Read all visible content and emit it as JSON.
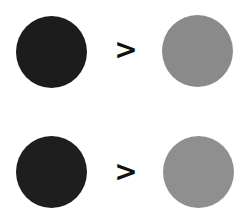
{
  "rows": [
    {
      "left": {
        "color": "#1c1c1c"
      },
      "operator": ">",
      "right": {
        "color": "#8a8a8a"
      }
    },
    {
      "left": {
        "color": "#1e1e1e"
      },
      "operator": ">",
      "right": {
        "color": "#8f8f8f"
      }
    }
  ]
}
